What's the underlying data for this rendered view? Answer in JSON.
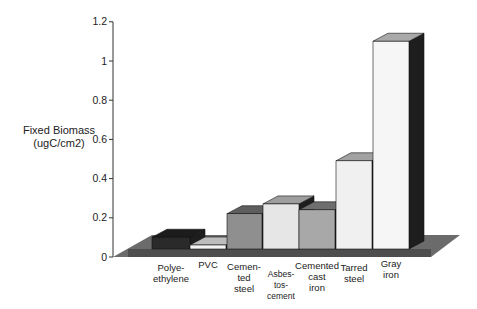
{
  "chart_data": {
    "type": "bar",
    "style": "3d",
    "title": "",
    "xlabel": "",
    "ylabel": "Fixed Biomass (ugC/cm2)",
    "ylabel_lines": [
      "Fixed Biomass",
      "(ugC/cm2)"
    ],
    "ylim": [
      0,
      1.2
    ],
    "yticks": [
      0,
      0.2,
      0.4,
      0.6,
      0.8,
      1,
      1.2
    ],
    "ytick_labels": [
      "0",
      "0.2",
      "0.4",
      "0.6",
      "0.8",
      "1",
      "1.2"
    ],
    "grid": false,
    "legend": null,
    "categories": [
      "Polyethylene",
      "PVC",
      "Cemented steel",
      "Asbestos-cement",
      "Cemented cast iron",
      "Tarred steel",
      "Gray iron"
    ],
    "category_labels": [
      "Polye-\nethylene",
      "PVC",
      "Cemen-\nted\nsteel",
      "Asbes-\ntos-\ncement",
      "Cemented\ncast\niron",
      "Tarred\nsteel",
      "Gray\niron"
    ],
    "values": [
      0.06,
      0.02,
      0.18,
      0.23,
      0.2,
      0.45,
      1.06
    ],
    "bar_colors": [
      "#2a2a2a",
      "#f4f4f4",
      "#8f8f8f",
      "#e6e6e6",
      "#a8a8a8",
      "#f0f0f0",
      "#f6f6f6"
    ],
    "top_colors": [
      "#1c1c1c",
      "#bdbdbd",
      "#5e5e5e",
      "#9e9e9e",
      "#6e6e6e",
      "#a2a2a2",
      "#a9a9a9"
    ],
    "floor_color": "#6b6b6b"
  }
}
